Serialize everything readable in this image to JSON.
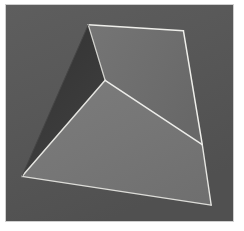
{
  "scene": {
    "title": "Faceted Polyhedron Render",
    "canvas": {
      "width": 244,
      "height": 231,
      "page_background": "#ffffff"
    },
    "frame": {
      "label": "render-frame",
      "x": 5,
      "y": 4,
      "width": 229,
      "height": 218,
      "border_color": "#cfcfcf",
      "border_width": 1
    },
    "background": {
      "label": "Background plane",
      "color": "#575757",
      "gradient_from": "#5d5d5d",
      "gradient_to": "#515151"
    },
    "lighting": {
      "label": "Key light",
      "direction": "upper-right",
      "edge_highlight_color": "#e8e8e4",
      "edge_highlight_width": 1.4
    },
    "facets": [
      {
        "id": "facet-shadow-left",
        "label": "Left shadow facet",
        "fill": "#393939",
        "shading": "occluded",
        "points": "88,24 105,80 21,177"
      },
      {
        "id": "facet-upper",
        "label": "Upper lit facet",
        "fill": "#6f6f6f",
        "shading": "lit",
        "points": "88,24 184,30 203,145 105,80"
      },
      {
        "id": "facet-lower-main",
        "label": "Lower main facet",
        "fill": "#767676",
        "shading": "lit",
        "points": "105,80 203,145 212,206 21,177"
      }
    ],
    "edges": [
      {
        "id": "edge-top",
        "label": "Top ridge edge",
        "from": "88,24",
        "to": "184,30",
        "color": "#eeeeea"
      },
      {
        "id": "edge-right-upper",
        "label": "Right upper edge",
        "from": "184,30",
        "to": "203,145",
        "color": "#efefeb"
      },
      {
        "id": "edge-right-lower",
        "label": "Right lower edge",
        "from": "203,145",
        "to": "212,206",
        "color": "#e6e6e2"
      },
      {
        "id": "edge-bottom",
        "label": "Bottom edge",
        "from": "212,206",
        "to": "21,177",
        "color": "#dcdcd8"
      },
      {
        "id": "edge-left-lower",
        "label": "Left lower edge",
        "from": "21,177",
        "to": "105,80",
        "color": "#e4e4e0"
      },
      {
        "id": "edge-left-upper",
        "label": "Left upper silhouette",
        "from": "21,177",
        "to": "88,24",
        "color": "#4a4a4a"
      },
      {
        "id": "edge-crease-upper",
        "label": "Upper crease",
        "from": "88,24",
        "to": "105,80",
        "color": "#d8d8d4"
      },
      {
        "id": "edge-crease-diagonal",
        "label": "Diagonal crease",
        "from": "105,80",
        "to": "203,145",
        "color": "#ededea"
      }
    ],
    "vertices": [
      {
        "id": "vertex-apex",
        "label": "Top apex",
        "x": 88,
        "y": 24
      },
      {
        "id": "vertex-top-right",
        "label": "Top right",
        "x": 184,
        "y": 30
      },
      {
        "id": "vertex-mid-junction",
        "label": "Central junction",
        "x": 105,
        "y": 80
      },
      {
        "id": "vertex-right-junction",
        "label": "Right junction",
        "x": 203,
        "y": 145
      },
      {
        "id": "vertex-bottom-left",
        "label": "Bottom left",
        "x": 21,
        "y": 177
      },
      {
        "id": "vertex-bottom-right",
        "label": "Bottom right",
        "x": 212,
        "y": 206
      }
    ]
  }
}
